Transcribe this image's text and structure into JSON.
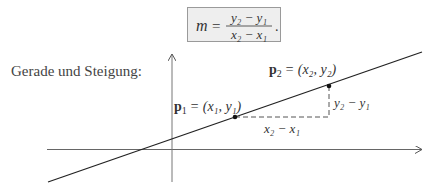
{
  "formula": {
    "lhs": "m",
    "equals": "=",
    "numerator": "y₂ − y₁",
    "denominator": "x₂ − x₁",
    "trailing": "."
  },
  "caption": "Gerade und Steigung:",
  "figure": {
    "p1_label": {
      "name": "p",
      "sub": "1",
      "rhs": "= (x₁, y₁)"
    },
    "p2_label": {
      "name": "p",
      "sub": "2",
      "rhs": "= (x₂, y₂)"
    },
    "dx_label": "x₂ − x₁",
    "dy_label": "y₂ − y₁",
    "points": {
      "p1": [
        235,
        117
      ],
      "p2": [
        329,
        86
      ]
    }
  }
}
